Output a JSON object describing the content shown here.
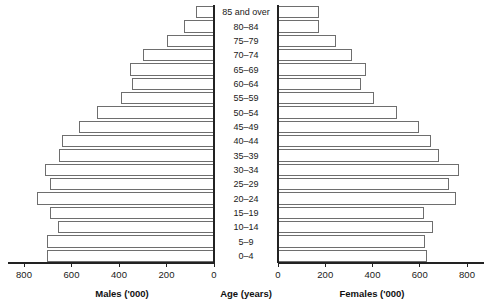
{
  "chart_data": {
    "type": "bar",
    "title": "",
    "subtitle": "",
    "orientation": "horizontal",
    "layout": "population-pyramid",
    "categories": [
      "0–4",
      "5–9",
      "10–14",
      "15–19",
      "20–24",
      "25–29",
      "30–34",
      "35–39",
      "40–44",
      "45–49",
      "50–54",
      "55–59",
      "60–64",
      "65–69",
      "70–74",
      "75–79",
      "80–84",
      "85 and over"
    ],
    "series": [
      {
        "name": "Males ('000)",
        "side": "left",
        "values": [
          700,
          700,
          655,
          690,
          745,
          690,
          710,
          650,
          640,
          565,
          490,
          390,
          345,
          350,
          295,
          195,
          125,
          75
        ]
      },
      {
        "name": "Females ('000)",
        "side": "right",
        "values": [
          630,
          620,
          655,
          615,
          750,
          720,
          765,
          680,
          645,
          595,
          500,
          405,
          350,
          370,
          310,
          245,
          170,
          170
        ]
      }
    ],
    "left_axis": {
      "label": "Males ('000)",
      "ticks": [
        800,
        600,
        400,
        200,
        0
      ],
      "tick_labels": [
        "800",
        "600",
        "400",
        "200",
        "0"
      ],
      "min": 0,
      "max": 880,
      "direction": "reversed"
    },
    "right_axis": {
      "label": "Females ('000)",
      "ticks": [
        0,
        200,
        400,
        600,
        800
      ],
      "tick_labels": [
        "0",
        "200",
        "400",
        "600",
        "800"
      ],
      "min": 0,
      "max": 880,
      "direction": "normal"
    },
    "center_axis": {
      "label": "Age (years)"
    },
    "grid": false,
    "legend": "none"
  },
  "axis_titles": {
    "left": "Males ('000)",
    "center": "Age (years)",
    "right": "Females ('000)"
  }
}
